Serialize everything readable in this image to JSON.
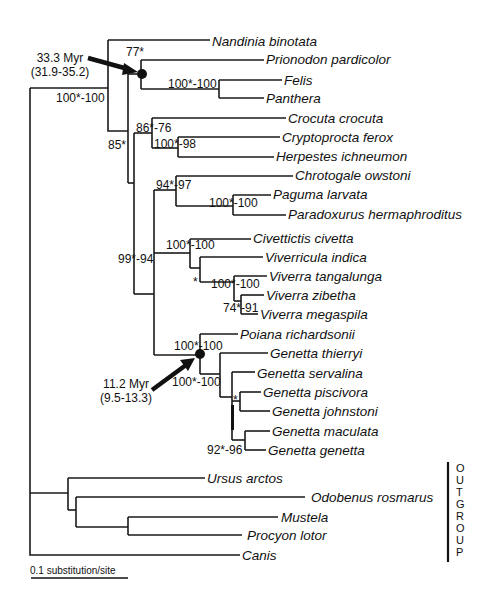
{
  "tree": {
    "taxa": [
      {
        "name": "Nandinia binotata",
        "x": 212,
        "y": 41
      },
      {
        "name": "Prionodon pardicolor",
        "x": 266,
        "y": 59
      },
      {
        "name": "Felis",
        "x": 284,
        "y": 81
      },
      {
        "name": "Panthera",
        "x": 266,
        "y": 99
      },
      {
        "name": "Crocuta crocuta",
        "x": 288,
        "y": 119
      },
      {
        "name": "Cryptoprocta ferox",
        "x": 282,
        "y": 138
      },
      {
        "name": "Herpestes ichneumon",
        "x": 276,
        "y": 157
      },
      {
        "name": "Chrotogale owstoni",
        "x": 295,
        "y": 176
      },
      {
        "name": "Paguma larvata",
        "x": 273,
        "y": 195
      },
      {
        "name": "Paradoxurus hermaphroditus",
        "x": 288,
        "y": 214
      },
      {
        "name": "Civettictis civetta",
        "x": 253,
        "y": 238
      },
      {
        "name": "Viverricula indica",
        "x": 265,
        "y": 257
      },
      {
        "name": "Viverra tangalunga",
        "x": 269,
        "y": 276
      },
      {
        "name": "Viverra zibetha",
        "x": 266,
        "y": 295
      },
      {
        "name": "Viverra megaspila",
        "x": 260,
        "y": 314
      },
      {
        "name": "Poiana richardsonii",
        "x": 240,
        "y": 334
      },
      {
        "name": "Genetta thierryi",
        "x": 270,
        "y": 353
      },
      {
        "name": "Genetta servalina",
        "x": 259,
        "y": 374
      },
      {
        "name": "Genetta piscivora",
        "x": 263,
        "y": 393
      },
      {
        "name": "Genetta johnstoni",
        "x": 272,
        "y": 412
      },
      {
        "name": "Genetta maculata",
        "x": 272,
        "y": 432
      },
      {
        "name": "Genetta genetta",
        "x": 268,
        "y": 451
      },
      {
        "name": "Ursus arctos",
        "x": 207,
        "y": 480
      },
      {
        "name": "Odobenus rosmarus",
        "x": 311,
        "y": 499
      },
      {
        "name": "Mustela",
        "x": 281,
        "y": 518
      },
      {
        "name": "Procyon lotor",
        "x": 247,
        "y": 536
      },
      {
        "name": "Canis",
        "x": 242,
        "y": 556
      }
    ],
    "support_values": [
      {
        "text": "77*",
        "x": 126,
        "y": 54
      },
      {
        "text": "100*-100",
        "x": 30,
        "y": 100
      },
      {
        "text": "100*-100",
        "x": 168,
        "y": 88
      },
      {
        "text": "86*-76",
        "x": 136,
        "y": 133
      },
      {
        "text": "100*-98",
        "x": 154,
        "y": 150
      },
      {
        "text": "85*",
        "x": 108,
        "y": 150
      },
      {
        "text": "94*-97",
        "x": 156,
        "y": 189
      },
      {
        "text": "100*-100",
        "x": 208,
        "y": 208
      },
      {
        "text": "100*-100",
        "x": 166,
        "y": 250
      },
      {
        "text": "99*-94",
        "x": 118,
        "y": 263
      },
      {
        "text": "*",
        "x": 193,
        "y": 288
      },
      {
        "text": "100*-100",
        "x": 211,
        "y": 289
      },
      {
        "text": "74*-91",
        "x": 224,
        "y": 311
      },
      {
        "text": "100*-100",
        "x": 174,
        "y": 349
      },
      {
        "text": "100*-100",
        "x": 172,
        "y": 386
      },
      {
        "text": "*",
        "x": 234,
        "y": 402
      },
      {
        "text": "92*-96",
        "x": 207,
        "y": 452
      }
    ],
    "node_annotations": [
      {
        "age": "33.3 Myr",
        "interval": "(31.9-35.2)",
        "x": 56,
        "y": 60
      },
      {
        "age": "11.2 Myr",
        "interval": "(9.5-13.3)",
        "x": 127,
        "y": 386
      }
    ],
    "outgroup_label": "OUTGROUP",
    "scale_bar": {
      "label": "0.1 substitution/site"
    }
  }
}
